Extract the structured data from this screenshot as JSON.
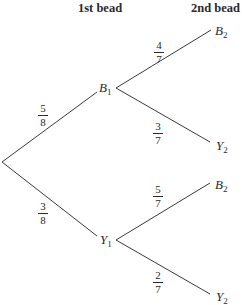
{
  "headers": {
    "first": "1st bead",
    "second": "2nd bead"
  },
  "nodes": {
    "b1": {
      "letter": "B",
      "sub": "1"
    },
    "y1": {
      "letter": "Y",
      "sub": "1"
    },
    "b1_b2": {
      "letter": "B",
      "sub": "2"
    },
    "b1_y2": {
      "letter": "Y",
      "sub": "2"
    },
    "y1_b2": {
      "letter": "B",
      "sub": "2"
    },
    "y1_y2": {
      "letter": "Y",
      "sub": "2"
    }
  },
  "branches": {
    "root_b1": {
      "num": "5",
      "den": "8"
    },
    "root_y1": {
      "num": "3",
      "den": "8"
    },
    "b1_b2": {
      "num": "4",
      "den": "7"
    },
    "b1_y2": {
      "num": "3",
      "den": "7"
    },
    "y1_b2": {
      "num": "5",
      "den": "7"
    },
    "y1_y2": {
      "num": "2",
      "den": "7"
    }
  },
  "colors": {
    "line": "#3a3a3a",
    "text": "#2a2a2a",
    "background": "#ffffff"
  }
}
